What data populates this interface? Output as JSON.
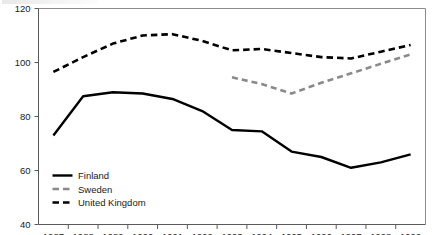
{
  "chart_data": {
    "type": "line",
    "title": "",
    "subtitle": "",
    "xlabel": "",
    "ylabel": "",
    "categories": [
      "1987",
      "1988",
      "1989",
      "1990",
      "1991",
      "1992",
      "1993",
      "1994",
      "1995",
      "1996",
      "1997",
      "1998",
      "1999"
    ],
    "x": [
      1987,
      1988,
      1989,
      1990,
      1991,
      1992,
      1993,
      1994,
      1995,
      1996,
      1997,
      1998,
      1999
    ],
    "ylim": [
      40,
      120
    ],
    "yticks": [
      40,
      60,
      80,
      100,
      120
    ],
    "xlim": [
      1987,
      1999
    ],
    "grid": false,
    "legend_position": "inside-bottom-left",
    "series": [
      {
        "name": "Finland",
        "style": "solid",
        "color": "#000000",
        "values": [
          73,
          87.5,
          89,
          88.5,
          86.5,
          82,
          75,
          74.5,
          67,
          65,
          61,
          63,
          66
        ]
      },
      {
        "name": "Sweden",
        "style": "dashed",
        "color": "#8a8a8a",
        "values": [
          null,
          null,
          null,
          null,
          null,
          null,
          94.5,
          92,
          88.5,
          92.5,
          96,
          99.5,
          103
        ]
      },
      {
        "name": "United Kingdom",
        "style": "dashed",
        "color": "#000000",
        "values": [
          96.5,
          102,
          107,
          110,
          110.5,
          108,
          104.5,
          105,
          103.5,
          102,
          101.5,
          104,
          106.5
        ]
      }
    ]
  },
  "axes": {
    "y_tick_labels": [
      "120",
      "100",
      "80",
      "60",
      "40"
    ],
    "x_tick_labels": [
      "1987",
      "1988",
      "1989",
      "1990",
      "1991",
      "1992",
      "1993",
      "1994",
      "1995",
      "1996",
      "1997",
      "1998",
      "1999"
    ]
  },
  "legend": {
    "items": [
      {
        "label": "Finland",
        "swatch": "solid-black-line"
      },
      {
        "label": "Sweden",
        "swatch": "dashed-gray-line"
      },
      {
        "label": "United Kingdom",
        "swatch": "dashed-black-line"
      }
    ]
  }
}
